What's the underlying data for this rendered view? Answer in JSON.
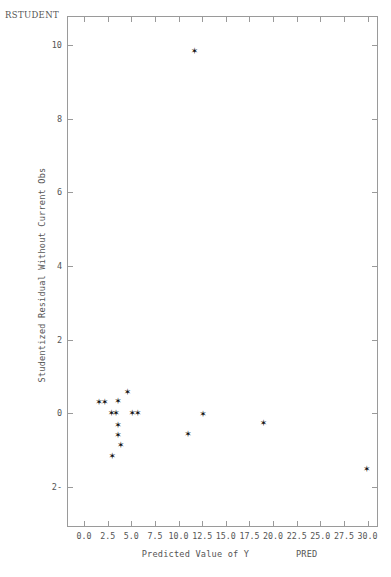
{
  "corner_label": "RSTUDENT",
  "axes": {
    "x": {
      "title": "Predicted Value of Y",
      "variable": "PRED",
      "min": -1.8,
      "max": 31.1,
      "ticks": [
        0.0,
        2.5,
        5.0,
        7.5,
        10.0,
        12.5,
        15.0,
        17.5,
        20.0,
        22.5,
        25.0,
        27.5,
        30.0
      ],
      "tick_labels": [
        "0.0",
        "2.5",
        "5.0",
        "7.5",
        "10.0",
        "12.5",
        "15.0",
        "17.5",
        "20.0",
        "22.5",
        "25.0",
        "27.5",
        "30.0"
      ]
    },
    "y": {
      "title": "Studentized Residual Without Current Obs",
      "min": -3.1,
      "max": 10.8,
      "ticks": [
        -2,
        0,
        2,
        4,
        6,
        8,
        10
      ],
      "tick_labels": [
        "-2",
        "0",
        "2",
        "4",
        "6",
        "8",
        "10"
      ]
    }
  },
  "marker": {
    "glyph": "✶",
    "color": "#111111"
  },
  "chart_data": {
    "type": "scatter",
    "title": "",
    "xlabel": "Predicted Value of Y",
    "ylabel": "Studentized Residual Without Current Obs",
    "xlim": [
      -1.8,
      31.1
    ],
    "ylim": [
      -3.1,
      10.8
    ],
    "grid": false,
    "legend": null,
    "series": [
      {
        "name": "RSTUDENT vs PRED",
        "points": [
          {
            "x": 1.6,
            "y": 0.3
          },
          {
            "x": 2.2,
            "y": 0.3
          },
          {
            "x": 3.6,
            "y": 0.33
          },
          {
            "x": 4.6,
            "y": 0.58
          },
          {
            "x": 2.9,
            "y": 0.0
          },
          {
            "x": 3.4,
            "y": 0.0
          },
          {
            "x": 5.1,
            "y": 0.0
          },
          {
            "x": 5.7,
            "y": 0.0
          },
          {
            "x": 3.6,
            "y": -0.33
          },
          {
            "x": 3.6,
            "y": -0.6
          },
          {
            "x": 3.9,
            "y": -0.86
          },
          {
            "x": 3.0,
            "y": -1.17
          },
          {
            "x": 11.0,
            "y": -0.57
          },
          {
            "x": 12.6,
            "y": -0.02
          },
          {
            "x": 19.0,
            "y": -0.27
          },
          {
            "x": 29.9,
            "y": -1.52
          },
          {
            "x": 11.7,
            "y": 9.85
          }
        ]
      }
    ]
  }
}
